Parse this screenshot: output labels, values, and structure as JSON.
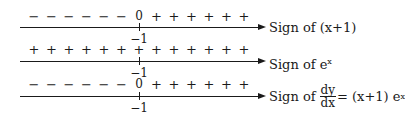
{
  "diagram": {
    "type": "sign-chart",
    "critical_point": "-1",
    "rows": [
      {
        "id": "x_plus_1",
        "symbols": [
          "−",
          "−",
          "−",
          "−",
          "−",
          "−",
          "0",
          "+",
          "+",
          "+",
          "+",
          "+",
          "+"
        ],
        "tick_label": "−1",
        "label_prefix": "Sign of (x+1)",
        "label_sup": ""
      },
      {
        "id": "exp_x",
        "symbols": [
          "+",
          "+",
          "+",
          "+",
          "+",
          "+",
          "+",
          "+",
          "+",
          "+",
          "+",
          "+",
          "+"
        ],
        "tick_label": "−1",
        "label_prefix": "Sign of e",
        "label_sup": "x"
      },
      {
        "id": "dy_dx",
        "symbols": [
          "−",
          "−",
          "−",
          "−",
          "−",
          "−",
          "0",
          "+",
          "+",
          "+",
          "+",
          "+",
          "+"
        ],
        "tick_label": "−1",
        "label_prefix": "Sign of",
        "frac_num": "dy",
        "frac_den": "dx",
        "label_suffix": "= (x+1) e",
        "label_sup": "x"
      }
    ]
  }
}
